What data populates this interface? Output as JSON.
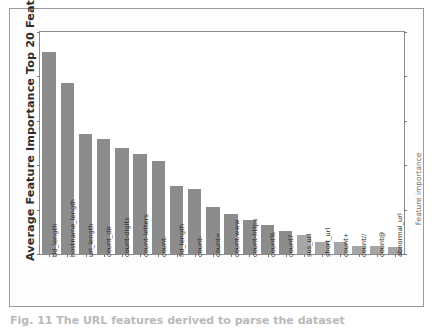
{
  "figure": {
    "ylabel_left": "Average Feature Importance Top 20 Features",
    "ylabel_right": "Feature importance",
    "caption": "Fig. 11   The URL features derived to parse the dataset",
    "bar_color": "#8c8c8c",
    "bar_color_light": "#a6a6a6",
    "frame_color": "#9a9a9a",
    "axis_color": "#8d8d8d"
  },
  "chart_data": {
    "type": "bar",
    "title": "Average Feature Importance Top 20 Features",
    "xlabel": "",
    "ylabel": "Average Feature Importance Top 20 Features",
    "ylabel_secondary": "Feature importance",
    "grid": false,
    "legend": false,
    "ylim": [
      0,
      0.115
    ],
    "yticks_labeled": false,
    "ytick_count": 6,
    "categories": [
      "tld_length",
      "hostname_length",
      "url_length",
      "count_dir",
      "count-digits",
      "count-letters",
      "count.",
      "fld_length",
      "count-",
      "count=",
      "count.www",
      "count-https",
      "count%",
      "count?",
      "sus_url",
      "short_url",
      "count+",
      "count//",
      "count@",
      "abnormal_url"
    ],
    "values": [
      0.1045,
      0.0885,
      0.062,
      0.0595,
      0.0548,
      0.0518,
      0.048,
      0.035,
      0.0338,
      0.0245,
      0.0205,
      0.0178,
      0.0148,
      0.0118,
      0.0098,
      0.0062,
      0.006,
      0.0042,
      0.004,
      0.0038
    ]
  }
}
